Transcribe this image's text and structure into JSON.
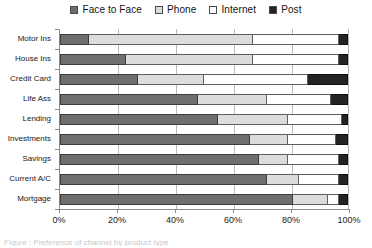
{
  "chart_data": {
    "type": "bar",
    "orientation": "horizontal",
    "stacked": true,
    "title": "",
    "xlabel": "",
    "ylabel": "",
    "xlim": [
      0,
      100
    ],
    "xticks": [
      "0%",
      "20%",
      "40%",
      "60%",
      "80%",
      "100%"
    ],
    "xtick_values": [
      0,
      20,
      40,
      60,
      80,
      100
    ],
    "grid": true,
    "legend_position": "top-center",
    "categories": [
      "Motor Ins",
      "House Ins",
      "Credit Card",
      "Life Ass",
      "Lending",
      "Investments",
      "Savings",
      "Current A/C",
      "Mortgage"
    ],
    "series": [
      {
        "name": "Face to Face",
        "color": "#6e6e6e",
        "values": [
          10,
          23,
          27,
          48,
          55,
          66,
          69,
          72,
          81
        ]
      },
      {
        "name": "Phone",
        "color": "#dcdcdc",
        "values": [
          57,
          44,
          23,
          24,
          24,
          13,
          10,
          11,
          12
        ]
      },
      {
        "name": "Internet",
        "color": "#ffffff",
        "values": [
          30,
          30,
          36,
          22,
          19,
          17,
          18,
          14,
          4
        ]
      },
      {
        "name": "Post",
        "color": "#232323",
        "values": [
          3,
          3,
          14,
          6,
          2,
          4,
          3,
          3,
          3
        ]
      }
    ]
  },
  "legend": {
    "items": [
      {
        "label": "Face to Face",
        "color": "#6e6e6e"
      },
      {
        "label": "Phone",
        "color": "#dcdcdc"
      },
      {
        "label": "Internet",
        "color": "#ffffff"
      },
      {
        "label": "Post",
        "color": "#232323"
      }
    ]
  },
  "caption": {
    "text": "Figure : Preference of channel by product type"
  }
}
